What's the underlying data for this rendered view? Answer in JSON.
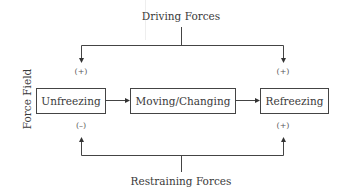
{
  "diagram": {
    "title_top": "Driving Forces",
    "title_bottom": "Restraining Forces",
    "axis_label": "Force Field",
    "stages": [
      {
        "label": "Unfreezing",
        "top_sign": "(+)",
        "bottom_sign": "(–)"
      },
      {
        "label": "Moving/Changing"
      },
      {
        "label": "Refreezing",
        "top_sign": "(+)",
        "bottom_sign": "(+)"
      }
    ],
    "colors": {
      "line": "#444444",
      "text": "#3a3a3a"
    }
  }
}
